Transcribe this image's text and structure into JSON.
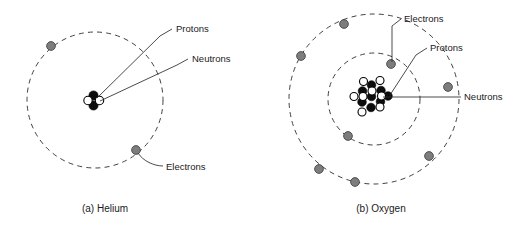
{
  "figure": {
    "background_color": "#ffffff",
    "width": 532,
    "height": 238
  },
  "colors": {
    "electron_fill": "#7d7d7d",
    "electron_stroke": "#3a3a3a",
    "proton_fill": "#0d0d0d",
    "neutron_fill": "#ffffff",
    "line": "#2b2b2b",
    "text": "#1a1a1a"
  },
  "legend_terms": {
    "protons": "Protons",
    "neutrons": "Neutrons",
    "electrons": "Electrons"
  },
  "atoms": [
    {
      "id": "helium",
      "caption": "(a)  Helium",
      "caption_x": 105,
      "caption_y": 212,
      "center": {
        "x": 95,
        "y": 100
      },
      "shells": [
        {
          "name": "shell-1",
          "radius": 68
        }
      ],
      "electrons": [
        {
          "x": 51,
          "y": 46
        },
        {
          "x": 136,
          "y": 150
        }
      ],
      "nucleus": {
        "protons": [
          {
            "x": 93.5,
            "y": 95.5,
            "r": 4.6
          },
          {
            "x": 93.5,
            "y": 105.5,
            "r": 4.6
          }
        ],
        "neutrons": [
          {
            "x": 88.0,
            "y": 100.5,
            "r": 4.2
          },
          {
            "x": 99.5,
            "y": 100.5,
            "r": 4.2
          }
        ]
      },
      "labels": [
        {
          "id": "helium-protons-label",
          "term": "Protons",
          "text_x": 176,
          "text_y": 32,
          "anchor": "start",
          "leader": "M 172 29 L 160 36 L 97 98"
        },
        {
          "id": "helium-neutrons-label",
          "term": "Neutrons",
          "text_x": 192,
          "text_y": 62,
          "anchor": "start",
          "leader": "M 188 59 L 177 65 L 100 101"
        },
        {
          "id": "helium-electrons-label",
          "term": "Electrons",
          "text_x": 166,
          "text_y": 170,
          "anchor": "start",
          "leader": "M 163 166 C 154 166 143 161 138 153"
        }
      ]
    },
    {
      "id": "oxygen",
      "caption": "(b)  Oxygen",
      "caption_x": 381,
      "caption_y": 212,
      "center": {
        "x": 374,
        "y": 99
      },
      "shells": [
        {
          "name": "shell-1",
          "radius": 46
        },
        {
          "name": "shell-2",
          "radius": 85
        }
      ],
      "electrons": [
        {
          "x": 391,
          "y": 64,
          "shell": 1
        },
        {
          "x": 348,
          "y": 136,
          "shell": 1
        },
        {
          "x": 344,
          "y": 24,
          "shell": 2
        },
        {
          "x": 301,
          "y": 56,
          "shell": 2
        },
        {
          "x": 448,
          "y": 87,
          "shell": 2
        },
        {
          "x": 429,
          "y": 156,
          "shell": 2
        },
        {
          "x": 319,
          "y": 169,
          "shell": 2
        },
        {
          "x": 355,
          "y": 182,
          "shell": 2
        }
      ],
      "nucleus": {
        "protons": [
          {
            "x": 371.5,
            "y": 85.0,
            "r": 4.3
          },
          {
            "x": 381.0,
            "y": 90.5,
            "r": 4.3
          },
          {
            "x": 362.5,
            "y": 91.0,
            "r": 4.3
          },
          {
            "x": 371.5,
            "y": 96.5,
            "r": 4.3
          },
          {
            "x": 380.5,
            "y": 101.5,
            "r": 4.3
          },
          {
            "x": 362.0,
            "y": 102.0,
            "r": 4.3
          },
          {
            "x": 371.0,
            "y": 107.5,
            "r": 4.3
          },
          {
            "x": 388.0,
            "y": 96.0,
            "r": 4.3
          }
        ],
        "neutrons": [
          {
            "x": 380.0,
            "y": 80.5,
            "r": 4.0
          },
          {
            "x": 363.5,
            "y": 81.5,
            "r": 4.0
          },
          {
            "x": 354.0,
            "y": 96.5,
            "r": 4.0
          },
          {
            "x": 372.0,
            "y": 91.0,
            "r": 4.0
          },
          {
            "x": 381.5,
            "y": 96.0,
            "r": 4.0
          },
          {
            "x": 363.0,
            "y": 96.5,
            "r": 4.0
          },
          {
            "x": 380.0,
            "y": 107.0,
            "r": 4.0
          },
          {
            "x": 362.0,
            "y": 112.0,
            "r": 4.0
          }
        ]
      },
      "labels": [
        {
          "id": "oxygen-electrons-label",
          "term": "Electrons",
          "text_x": 404,
          "text_y": 22,
          "anchor": "start",
          "leader": "M 401 19 L 392 26 L 392 62"
        },
        {
          "id": "oxygen-protons-label",
          "term": "Protons",
          "text_x": 430,
          "text_y": 51,
          "anchor": "start",
          "leader": "M 427 48 L 416 55 L 390 95"
        },
        {
          "id": "oxygen-neutrons-label",
          "term": "Neutrons",
          "text_x": 464,
          "text_y": 100,
          "anchor": "start",
          "leader": "M 461 97 L 383 97"
        }
      ]
    }
  ]
}
